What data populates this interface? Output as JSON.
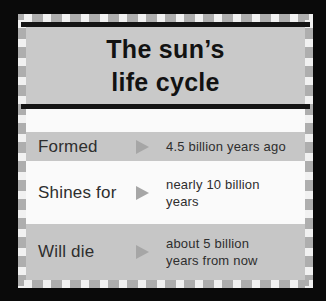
{
  "card": {
    "title": {
      "line1": "The sun’s",
      "line2": "life cycle"
    },
    "rows": [
      {
        "label": "Formed",
        "value": "4.5 billion years ago"
      },
      {
        "label": "Shines for",
        "value": "nearly 10 billion\nyears"
      },
      {
        "label": "Will die",
        "value": "about 5 billion\nyears from now"
      }
    ],
    "colors": {
      "page_background": "#0a0a0a",
      "border_gray": "#aeaeae",
      "border_dash_white": "#f1f1f1",
      "title_background": "#c9c9c9",
      "band_gray": "#c6c6c6",
      "row_white": "#fafafa",
      "rule_black": "#141414",
      "arrow_gray": "#a6a6a6",
      "text_black": "#121212"
    }
  }
}
